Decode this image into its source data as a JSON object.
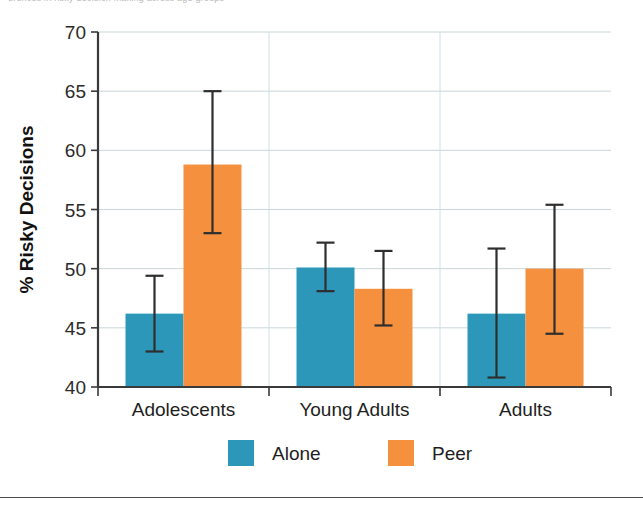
{
  "figure": {
    "top_caption_sliver": "erences in risky decision making across age groups",
    "footer_rule_visible": true
  },
  "chart_data": {
    "type": "bar",
    "title": "",
    "subtitle": "",
    "xlabel": "",
    "ylabel": "% Risky Decisions",
    "categories": [
      "Adolescents",
      "Young Adults",
      "Adults"
    ],
    "ylim": [
      40,
      70
    ],
    "ytick_labels": [
      "40",
      "45",
      "50",
      "55",
      "60",
      "65",
      "70"
    ],
    "yticks": [
      40,
      45,
      50,
      55,
      60,
      65,
      70
    ],
    "grid": "horizontal-and-vertical-group-separators",
    "legend_position": "bottom-center",
    "errorbar_type": "standard-error",
    "series": [
      {
        "name": "Alone",
        "color": "#2d97ba",
        "values": [
          46.2,
          50.1,
          46.2
        ],
        "err_low": [
          43.0,
          48.1,
          40.8
        ],
        "err_high": [
          49.4,
          52.2,
          51.7
        ]
      },
      {
        "name": "Peer",
        "color": "#f5913e",
        "values": [
          58.8,
          48.3,
          50.0
        ],
        "err_low": [
          53.0,
          45.2,
          44.5
        ],
        "err_high": [
          65.0,
          51.5,
          55.4
        ]
      }
    ],
    "legend": [
      {
        "label": "Alone",
        "color": "#2d97ba"
      },
      {
        "label": "Peer",
        "color": "#f5913e"
      }
    ],
    "colors": {
      "series_alone": "#2d97ba",
      "series_peer": "#f5913e",
      "gridline": "#c9d6da",
      "axis": "#3a3a3a",
      "errorbar": "#2e2e2e",
      "text": "#1e1e1e",
      "background": "#ffffff"
    }
  }
}
